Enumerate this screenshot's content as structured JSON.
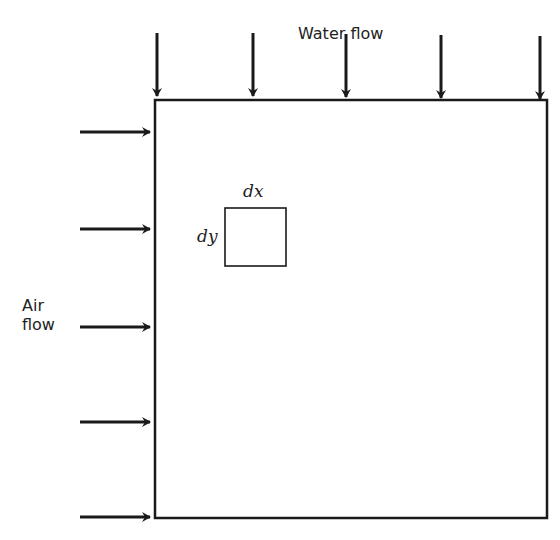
{
  "diagram": {
    "water_label": "Water flow",
    "air_label_line1": "Air",
    "air_label_line2": "flow",
    "element_dx": "dx",
    "element_dy": "dy",
    "colors": {
      "stroke": "#1a1a1a",
      "background": "#ffffff"
    },
    "water_arrows_x": [
      155,
      252,
      346,
      439,
      538
    ],
    "air_arrows_y": [
      132,
      229,
      327,
      422,
      517
    ],
    "domain_box": {
      "x": 155,
      "y": 100,
      "width": 392,
      "height": 418
    },
    "element_box": {
      "x": 225,
      "y": 208,
      "width": 61,
      "height": 58
    }
  }
}
